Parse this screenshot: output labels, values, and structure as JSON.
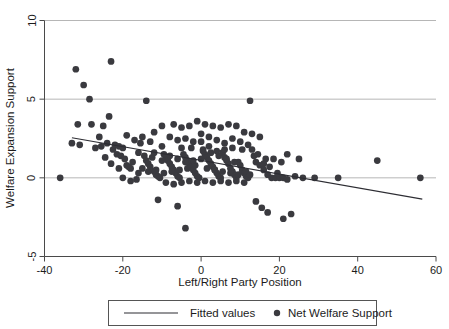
{
  "chart_data": {
    "type": "scatter",
    "title": "",
    "xlabel": "Left/Right Party Position",
    "ylabel": "Welfare Expansion Support",
    "xlim": [
      -40,
      60
    ],
    "ylim": [
      -5,
      10
    ],
    "xticks": [
      -40,
      -20,
      0,
      20,
      40,
      60
    ],
    "xtick_labels": [
      "-40",
      "-20",
      "0",
      "20",
      "40",
      "60"
    ],
    "yticks": [
      -5,
      0,
      5,
      10
    ],
    "ytick_labels": [
      "-5",
      "0",
      "5",
      "10"
    ],
    "gridlines": {
      "horizontal": [
        -5,
        0,
        5,
        10
      ],
      "vertical": []
    },
    "grid": true,
    "legend_position": "below-axes",
    "legend": [
      {
        "label": "Fitted values",
        "marker": "line",
        "color": "#3a3a3f"
      },
      {
        "label": "Net Welfare Support",
        "marker": "circle",
        "color": "#3a3a3f"
      }
    ],
    "series": [
      {
        "name": "Net Welfare Support",
        "type": "scatter",
        "marker": "circle",
        "color": "#3a3a3f",
        "points": [
          [
            -36.0,
            0.0
          ],
          [
            -32.0,
            6.9
          ],
          [
            -30.0,
            5.9
          ],
          [
            -28.5,
            5.0
          ],
          [
            -31.5,
            3.4
          ],
          [
            -28.0,
            3.4
          ],
          [
            -25.0,
            3.3
          ],
          [
            -23.5,
            3.9
          ],
          [
            -23.0,
            7.4
          ],
          [
            -26.0,
            2.6
          ],
          [
            -24.0,
            2.2
          ],
          [
            -22.0,
            2.1
          ],
          [
            -21.0,
            2.0
          ],
          [
            -20.0,
            1.9
          ],
          [
            -33.0,
            2.2
          ],
          [
            -31.0,
            2.1
          ],
          [
            -21.5,
            1.5
          ],
          [
            -20.5,
            1.4
          ],
          [
            -19.5,
            1.2
          ],
          [
            -19.0,
            0.8
          ],
          [
            -18.5,
            0.7
          ],
          [
            -18.0,
            0.6
          ],
          [
            -20.0,
            0.0
          ],
          [
            -17.5,
            1.0
          ],
          [
            -16.0,
            1.6
          ],
          [
            -15.0,
            2.6
          ],
          [
            -14.5,
            1.4
          ],
          [
            -14.0,
            1.1
          ],
          [
            -13.5,
            0.9
          ],
          [
            -13.0,
            0.7
          ],
          [
            -12.5,
            1.3
          ],
          [
            -12.0,
            0.4
          ],
          [
            -11.5,
            0.2
          ],
          [
            -11.0,
            0.1
          ],
          [
            -10.5,
            0.0
          ],
          [
            -16.5,
            -0.1
          ],
          [
            -10.0,
            2.0
          ],
          [
            -9.5,
            1.5
          ],
          [
            -9.0,
            1.3
          ],
          [
            -8.5,
            1.1
          ],
          [
            -8.0,
            0.9
          ],
          [
            -7.5,
            0.7
          ],
          [
            -7.0,
            0.5
          ],
          [
            -6.5,
            0.3
          ],
          [
            -6.0,
            0.1
          ],
          [
            -5.5,
            0.0
          ],
          [
            -5.0,
            1.9
          ],
          [
            -4.5,
            1.5
          ],
          [
            -4.0,
            1.3
          ],
          [
            -3.5,
            1.1
          ],
          [
            -3.0,
            0.9
          ],
          [
            -2.5,
            0.7
          ],
          [
            -2.0,
            0.5
          ],
          [
            -1.5,
            0.3
          ],
          [
            -1.0,
            0.1
          ],
          [
            -0.5,
            0.0
          ],
          [
            0.0,
            2.3
          ],
          [
            0.5,
            1.8
          ],
          [
            1.0,
            1.5
          ],
          [
            1.5,
            1.3
          ],
          [
            2.0,
            1.1
          ],
          [
            2.5,
            0.9
          ],
          [
            3.0,
            0.7
          ],
          [
            3.5,
            0.5
          ],
          [
            4.0,
            0.3
          ],
          [
            4.5,
            0.1
          ],
          [
            5.0,
            0.0
          ],
          [
            5.5,
            1.6
          ],
          [
            6.0,
            1.3
          ],
          [
            6.5,
            1.1
          ],
          [
            7.0,
            0.9
          ],
          [
            7.5,
            0.6
          ],
          [
            8.0,
            0.4
          ],
          [
            8.5,
            0.2
          ],
          [
            9.0,
            0.0
          ],
          [
            9.5,
            1.0
          ],
          [
            10.0,
            0.8
          ],
          [
            10.5,
            0.5
          ],
          [
            11.0,
            0.3
          ],
          [
            11.5,
            0.1
          ],
          [
            12.0,
            0.0
          ],
          [
            -12.0,
            2.9
          ],
          [
            -10.0,
            3.3
          ],
          [
            -7.0,
            3.4
          ],
          [
            -5.0,
            3.2
          ],
          [
            -3.0,
            3.3
          ],
          [
            -1.0,
            3.6
          ],
          [
            1.0,
            3.4
          ],
          [
            3.0,
            3.3
          ],
          [
            5.0,
            3.2
          ],
          [
            7.0,
            3.4
          ],
          [
            9.0,
            3.3
          ],
          [
            -8.0,
            2.6
          ],
          [
            -6.0,
            2.4
          ],
          [
            -4.0,
            2.5
          ],
          [
            -2.0,
            2.3
          ],
          [
            0.0,
            2.8
          ],
          [
            2.0,
            2.6
          ],
          [
            4.0,
            2.4
          ],
          [
            6.0,
            2.2
          ],
          [
            8.0,
            2.5
          ],
          [
            10.0,
            2.3
          ],
          [
            12.0,
            2.1
          ],
          [
            13.0,
            1.8
          ],
          [
            14.0,
            1.0
          ],
          [
            15.0,
            0.8
          ],
          [
            16.0,
            0.5
          ],
          [
            17.0,
            0.2
          ],
          [
            18.0,
            0.0
          ],
          [
            13.5,
            1.4
          ],
          [
            14.5,
            1.5
          ],
          [
            16.5,
            1.2
          ],
          [
            12.5,
            4.9
          ],
          [
            11.0,
            2.9
          ],
          [
            13.0,
            2.8
          ],
          [
            15.0,
            2.6
          ],
          [
            -14.0,
            4.9
          ],
          [
            -18.0,
            -0.2
          ],
          [
            -9.0,
            -0.3
          ],
          [
            -7.0,
            -0.4
          ],
          [
            -5.0,
            -0.3
          ],
          [
            -3.0,
            -0.2
          ],
          [
            -1.0,
            -0.3
          ],
          [
            1.0,
            -0.2
          ],
          [
            3.0,
            -0.3
          ],
          [
            5.0,
            -0.2
          ],
          [
            7.0,
            -0.3
          ],
          [
            9.0,
            -0.2
          ],
          [
            11.0,
            -0.3
          ],
          [
            -11.0,
            -1.4
          ],
          [
            -6.0,
            -1.8
          ],
          [
            -4.0,
            -3.2
          ],
          [
            14.0,
            -1.5
          ],
          [
            15.5,
            -1.9
          ],
          [
            17.0,
            -2.2
          ],
          [
            19.0,
            0.0
          ],
          [
            20.0,
            0.0
          ],
          [
            21.0,
            0.0
          ],
          [
            22.0,
            -0.1
          ],
          [
            20.5,
            1.0
          ],
          [
            18.5,
            1.2
          ],
          [
            22.0,
            1.5
          ],
          [
            24.0,
            0.1
          ],
          [
            26.0,
            0.0
          ],
          [
            23.0,
            -2.3
          ],
          [
            21.0,
            -2.6
          ],
          [
            25.0,
            1.2
          ],
          [
            29.0,
            0.0
          ],
          [
            35.0,
            0.0
          ],
          [
            45.0,
            1.1
          ],
          [
            56.0,
            0.0
          ],
          [
            -17.0,
            2.4
          ],
          [
            -15.5,
            2.2
          ],
          [
            -13.0,
            2.3
          ],
          [
            -2.5,
            1.9
          ],
          [
            0.5,
            1.7
          ],
          [
            2.5,
            1.6
          ],
          [
            4.5,
            1.4
          ],
          [
            6.5,
            1.2
          ],
          [
            8.5,
            1.0
          ],
          [
            -19.0,
            2.7
          ],
          [
            -22.5,
            1.8
          ],
          [
            -25.5,
            2.0
          ],
          [
            1.5,
            0.6
          ],
          [
            3.5,
            0.5
          ],
          [
            5.5,
            0.4
          ],
          [
            7.5,
            0.3
          ],
          [
            9.5,
            0.2
          ],
          [
            11.5,
            0.4
          ],
          [
            12.5,
            0.2
          ],
          [
            -1.5,
            0.8
          ],
          [
            -3.5,
            0.6
          ],
          [
            -5.5,
            0.5
          ],
          [
            -7.5,
            0.4
          ],
          [
            -9.5,
            0.3
          ],
          [
            -11.5,
            0.5
          ],
          [
            -13.5,
            0.4
          ],
          [
            -15.0,
            0.6
          ],
          [
            -16.0,
            0.3
          ],
          [
            10.5,
            1.8
          ],
          [
            8.0,
            1.9
          ],
          [
            6.0,
            1.8
          ],
          [
            4.0,
            1.7
          ],
          [
            2.0,
            2.0
          ],
          [
            0.0,
            1.2
          ],
          [
            -2.0,
            1.1
          ],
          [
            -4.0,
            1.0
          ],
          [
            -6.0,
            1.2
          ],
          [
            -8.0,
            1.4
          ],
          [
            -10.0,
            1.1
          ],
          [
            -12.0,
            1.6
          ],
          [
            16.0,
            0.9
          ],
          [
            17.5,
            0.7
          ],
          [
            19.5,
            0.3
          ],
          [
            -21.0,
            0.6
          ],
          [
            -23.0,
            0.9
          ],
          [
            -24.5,
            1.3
          ],
          [
            -27.0,
            1.9
          ]
        ]
      },
      {
        "name": "Fitted values",
        "type": "line",
        "color": "#2d2d33",
        "endpoints": [
          [
            -33.0,
            2.55
          ],
          [
            56.5,
            -1.35
          ]
        ],
        "slope": -0.0436,
        "intercept": 1.11
      }
    ]
  },
  "axes": {
    "x_axis_label": "Left/Right Party Position",
    "y_axis_label": "Welfare Expansion Support"
  },
  "legend_box": {
    "entries": [
      {
        "label": "Fitted values"
      },
      {
        "label": "Net Welfare Support"
      }
    ]
  }
}
